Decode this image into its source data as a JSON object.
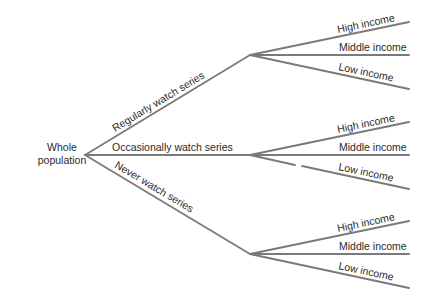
{
  "diagram": {
    "type": "tree",
    "line_color": "#7a7a7a",
    "text_color": "#2a2a2a",
    "root": {
      "label_line1": "Whole",
      "label_line2": "population"
    },
    "branches": [
      {
        "label": "Regularly watch series",
        "children": [
          "High income",
          "Middle income",
          "Low income"
        ]
      },
      {
        "label": "Occasionally watch series",
        "children": [
          "High income",
          "Middle income",
          "Low income"
        ]
      },
      {
        "label": "Never watch series",
        "children": [
          "High income",
          "Middle income",
          "Low income"
        ]
      }
    ]
  }
}
